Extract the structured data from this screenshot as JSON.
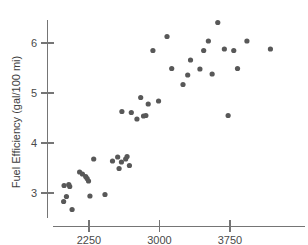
{
  "chart_data": {
    "type": "scatter",
    "title": "",
    "xlabel": "",
    "ylabel": "Fuel Efficiency (gal/100 mi)",
    "xlim": [
      1900,
      4250
    ],
    "ylim": [
      2.55,
      6.6
    ],
    "grid": false,
    "legend": "none",
    "xticks": [
      2250,
      3000,
      3750
    ],
    "xtick_labels": [
      "2250",
      "3000",
      "3750"
    ],
    "yticks": [
      3,
      4,
      5,
      6
    ],
    "ytick_labels": [
      "3",
      "4",
      "5",
      "6"
    ],
    "point_color": "#585858",
    "axis_color": "#757575",
    "series": [
      {
        "name": "vehicles",
        "x": [
          1980,
          1985,
          2010,
          2035,
          2045,
          2070,
          2150,
          2180,
          2215,
          2230,
          2245,
          2260,
          2300,
          2420,
          2500,
          2555,
          2570,
          2595,
          2600,
          2640,
          2655,
          2680,
          2700,
          2760,
          2800,
          2830,
          2855,
          2880,
          2930,
          2990,
          3080,
          3130,
          3250,
          3300,
          3330,
          3430,
          3470,
          3520,
          3560,
          3620,
          3690,
          3730,
          3790,
          3830,
          3930,
          4180
        ],
        "y": [
          2.83,
          3.15,
          2.93,
          3.17,
          3.13,
          2.67,
          3.42,
          3.38,
          3.33,
          3.29,
          3.24,
          2.94,
          3.68,
          2.97,
          3.64,
          3.72,
          3.49,
          3.62,
          4.63,
          3.68,
          3.73,
          3.55,
          4.61,
          4.48,
          4.91,
          4.54,
          4.55,
          4.78,
          5.85,
          4.84,
          6.13,
          5.49,
          5.17,
          5.36,
          5.66,
          5.48,
          5.85,
          6.04,
          5.38,
          6.41,
          5.88,
          4.55,
          5.85,
          5.49,
          6.04,
          5.88
        ]
      }
    ]
  },
  "axis_title_y": "Fuel Efficiency (gal/100 mi)"
}
